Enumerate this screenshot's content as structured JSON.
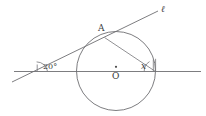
{
  "figure": {
    "type": "geometry-diagram",
    "background_color": "#ffffff",
    "stroke_color": "#6e6e72",
    "label_color": "#3a3a3a",
    "labels": {
      "line_ell": "ℓ",
      "point_a": "A",
      "center_o": "O",
      "angle_left": "20°",
      "angle_right": "x"
    },
    "geometry": {
      "circle": {
        "cx": 116,
        "cy": 71,
        "r": 39.5
      },
      "horizontal_line": {
        "x1": 14,
        "y1": 71.5,
        "x2": 201,
        "y2": 71.5
      },
      "slanted_line": {
        "x1": 12,
        "y1": 82,
        "x2": 158,
        "y2": 11
      },
      "chord": {
        "x1": 104.5,
        "y1": 37.5,
        "x2": 155.5,
        "y2": 71.5
      },
      "center_dot": {
        "cx": 116,
        "cy": 66.5,
        "r": 1.1
      },
      "angle_arc_left": {
        "cx": 37,
        "cy": 70,
        "r": 10
      },
      "angle_arc_right": {
        "cx": 155,
        "cy": 71,
        "r": 11
      }
    },
    "label_positions": {
      "line_ell": {
        "x": 161,
        "y": 11
      },
      "point_a": {
        "x": 98,
        "y": 30
      },
      "center_o": {
        "x": 112,
        "y": 78
      },
      "angle_left": {
        "x": 44,
        "y": 69
      },
      "angle_right": {
        "x": 142,
        "y": 69
      }
    }
  }
}
